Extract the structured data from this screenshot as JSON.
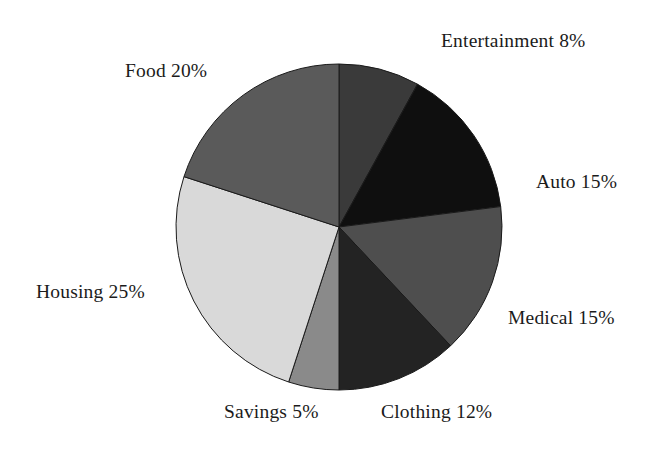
{
  "chart_data": {
    "type": "pie",
    "title": "",
    "xlabel": "",
    "ylabel": "",
    "legend": "none",
    "grid": false,
    "units": "percent",
    "total": 100,
    "start_angle_deg": 0,
    "direction": "clockwise",
    "categories": [
      "Entertainment",
      "Auto",
      "Medical",
      "Clothing",
      "Savings",
      "Housing",
      "Food"
    ],
    "values": [
      8,
      15,
      15,
      12,
      5,
      25,
      20
    ],
    "colors": [
      "#3a3a3a",
      "#0f0f0f",
      "#4e4e4e",
      "#232323",
      "#8a8a8a",
      "#d9d9d9",
      "#5a5a5a"
    ],
    "slices": [
      {
        "name": "Entertainment",
        "value": 8,
        "label": "Entertainment 8%",
        "color": "#3a3a3a",
        "start_deg": 0.0,
        "end_deg": 28.8
      },
      {
        "name": "Auto",
        "value": 15,
        "label": "Auto 15%",
        "color": "#0f0f0f",
        "start_deg": 28.8,
        "end_deg": 82.8
      },
      {
        "name": "Medical",
        "value": 15,
        "label": "Medical 15%",
        "color": "#4e4e4e",
        "start_deg": 82.8,
        "end_deg": 136.8
      },
      {
        "name": "Clothing",
        "value": 12,
        "label": "Clothing 12%",
        "color": "#232323",
        "start_deg": 136.8,
        "end_deg": 180.0
      },
      {
        "name": "Savings",
        "value": 5,
        "label": "Savings 5%",
        "color": "#8a8a8a",
        "start_deg": 180.0,
        "end_deg": 198.0
      },
      {
        "name": "Housing",
        "value": 25,
        "label": "Housing 25%",
        "color": "#d9d9d9",
        "start_deg": 198.0,
        "end_deg": 288.0
      },
      {
        "name": "Food",
        "value": 20,
        "label": "Food 20%",
        "color": "#5a5a5a",
        "start_deg": 288.0,
        "end_deg": 360.0
      }
    ],
    "geometry": {
      "center_x": 339,
      "center_y": 227,
      "radius": 163
    }
  },
  "labels": {
    "entertainment": "Entertainment 8%",
    "food": "Food 20%",
    "auto": "Auto 15%",
    "medical": "Medical 15%",
    "clothing": "Clothing 12%",
    "savings": "Savings 5%",
    "housing": "Housing 25%"
  }
}
